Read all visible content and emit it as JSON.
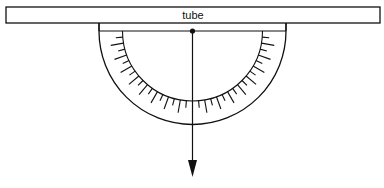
{
  "diagram": {
    "title": "",
    "tube": {
      "label": "tube",
      "x": 6,
      "y": 7,
      "width": 374,
      "height": 16
    },
    "protractor": {
      "center_x": 192.5,
      "center_y": 31,
      "outer_radius": 93.5,
      "inner_radius": 70,
      "baseline_y": 31,
      "tick_step_deg": 5,
      "long_tick_every_deg": 10,
      "long_tick_length": 13,
      "short_tick_length": 7
    },
    "pivot": {
      "x": 192.5,
      "y": 31,
      "label": ""
    },
    "plumb_line": {
      "x": 192.5,
      "y_start": 31,
      "y_end": 177,
      "arrow": "down"
    },
    "colors": {
      "stroke": "#111111",
      "background": "#ffffff"
    }
  }
}
